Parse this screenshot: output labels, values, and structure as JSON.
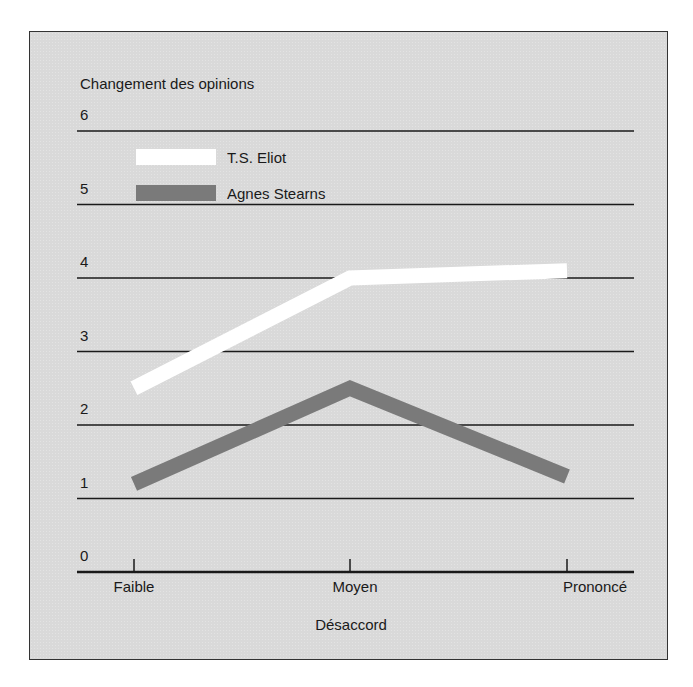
{
  "chart_data": {
    "type": "line",
    "title": "",
    "ylabel": "Changement des opinions",
    "xlabel": "Désaccord",
    "categories": [
      "Faible",
      "Moyen",
      "Prononcé"
    ],
    "yticks": [
      "0",
      "1",
      "2",
      "3",
      "4",
      "5",
      "6"
    ],
    "ylim": [
      0,
      6
    ],
    "grid": true,
    "legend_position": "top-left",
    "series": [
      {
        "name": "T.S. Eliot",
        "color": "#ffffff",
        "values": [
          2.5,
          4.0,
          4.1
        ]
      },
      {
        "name": "Agnes Stearns",
        "color": "#7a7a7a",
        "values": [
          1.2,
          2.5,
          1.3
        ]
      }
    ]
  },
  "legend": {
    "items": [
      {
        "label": "T.S. Eliot",
        "color": "#ffffff"
      },
      {
        "label": "Agnes Stearns",
        "color": "#7a7a7a"
      }
    ]
  },
  "colors": {
    "background": "#d9d9d9",
    "gridline": "#1a1a1a",
    "frame": "#333333"
  }
}
